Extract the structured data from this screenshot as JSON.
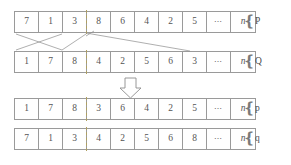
{
  "figure": {
    "ellipsis": "⋯",
    "nvar": "n",
    "rows": [
      {
        "id": "row-P",
        "label": "P",
        "cells": [
          "7",
          "1",
          "3",
          "8",
          "6",
          "4",
          "2",
          "5",
          "⋯",
          "n"
        ]
      },
      {
        "id": "row-Q",
        "label": "Q",
        "cells": [
          "1",
          "7",
          "8",
          "4",
          "2",
          "5",
          "6",
          "3",
          "⋯",
          "n"
        ]
      },
      {
        "id": "row-p",
        "label": "p",
        "cells": [
          "1",
          "7",
          "8",
          "3",
          "6",
          "4",
          "2",
          "5",
          "⋯",
          "n"
        ]
      },
      {
        "id": "row-q",
        "label": "q",
        "cells": [
          "7",
          "1",
          "3",
          "4",
          "2",
          "5",
          "6",
          "8",
          "⋯",
          "n"
        ]
      }
    ],
    "cut_point_after_cell": 3,
    "arrow": {
      "direction": "down",
      "name": "transform-arrow"
    },
    "colors": {
      "line": "#9a9a9a",
      "text": "#4a4a4a",
      "cut": "#b0a060",
      "background": "#ffffff"
    }
  }
}
